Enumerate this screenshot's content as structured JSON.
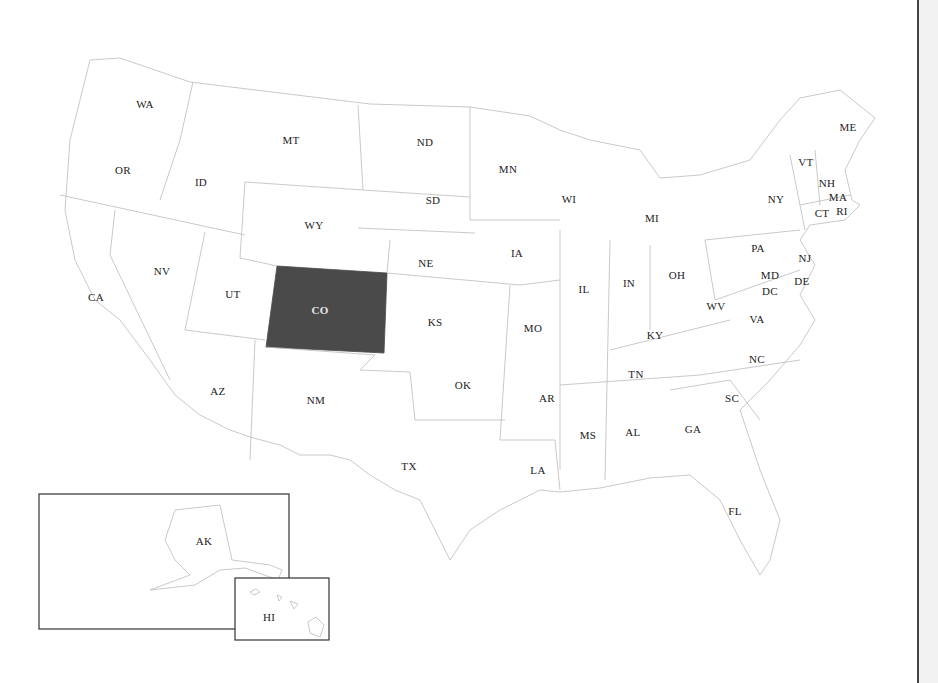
{
  "map": {
    "title": "United States map with Colorado highlighted",
    "highlight_color": "#4a4a4a",
    "highlighted_state": "CO",
    "states": [
      {
        "code": "WA",
        "x": 145,
        "y": 104
      },
      {
        "code": "OR",
        "x": 123,
        "y": 170
      },
      {
        "code": "CA",
        "x": 96,
        "y": 297
      },
      {
        "code": "ID",
        "x": 201,
        "y": 182
      },
      {
        "code": "NV",
        "x": 162,
        "y": 271
      },
      {
        "code": "MT",
        "x": 291,
        "y": 140
      },
      {
        "code": "WY",
        "x": 314,
        "y": 225
      },
      {
        "code": "UT",
        "x": 233,
        "y": 294
      },
      {
        "code": "CO",
        "x": 320,
        "y": 310
      },
      {
        "code": "AZ",
        "x": 218,
        "y": 391
      },
      {
        "code": "NM",
        "x": 316,
        "y": 400
      },
      {
        "code": "ND",
        "x": 425,
        "y": 142
      },
      {
        "code": "SD",
        "x": 433,
        "y": 200
      },
      {
        "code": "NE",
        "x": 426,
        "y": 263
      },
      {
        "code": "KS",
        "x": 435,
        "y": 322
      },
      {
        "code": "OK",
        "x": 463,
        "y": 385
      },
      {
        "code": "TX",
        "x": 409,
        "y": 466
      },
      {
        "code": "MN",
        "x": 508,
        "y": 169
      },
      {
        "code": "IA",
        "x": 517,
        "y": 253
      },
      {
        "code": "MO",
        "x": 533,
        "y": 328
      },
      {
        "code": "AR",
        "x": 547,
        "y": 398
      },
      {
        "code": "LA",
        "x": 538,
        "y": 470
      },
      {
        "code": "WI",
        "x": 569,
        "y": 199
      },
      {
        "code": "IL",
        "x": 584,
        "y": 289
      },
      {
        "code": "MI",
        "x": 652,
        "y": 218
      },
      {
        "code": "IN",
        "x": 629,
        "y": 283
      },
      {
        "code": "OH",
        "x": 677,
        "y": 275
      },
      {
        "code": "KY",
        "x": 655,
        "y": 335
      },
      {
        "code": "TN",
        "x": 636,
        "y": 374
      },
      {
        "code": "MS",
        "x": 588,
        "y": 435
      },
      {
        "code": "AL",
        "x": 633,
        "y": 432
      },
      {
        "code": "GA",
        "x": 693,
        "y": 429
      },
      {
        "code": "FL",
        "x": 735,
        "y": 511
      },
      {
        "code": "SC",
        "x": 732,
        "y": 398
      },
      {
        "code": "NC",
        "x": 757,
        "y": 359
      },
      {
        "code": "VA",
        "x": 757,
        "y": 319
      },
      {
        "code": "WV",
        "x": 716,
        "y": 306
      },
      {
        "code": "PA",
        "x": 758,
        "y": 248
      },
      {
        "code": "NY",
        "x": 776,
        "y": 199
      },
      {
        "code": "VT",
        "x": 806,
        "y": 162
      },
      {
        "code": "NH",
        "x": 827,
        "y": 183
      },
      {
        "code": "ME",
        "x": 848,
        "y": 127
      },
      {
        "code": "MA",
        "x": 838,
        "y": 197
      },
      {
        "code": "RI",
        "x": 842,
        "y": 211
      },
      {
        "code": "CT",
        "x": 822,
        "y": 213
      },
      {
        "code": "NJ",
        "x": 805,
        "y": 258
      },
      {
        "code": "DE",
        "x": 802,
        "y": 281
      },
      {
        "code": "MD",
        "x": 770,
        "y": 275
      },
      {
        "code": "DC",
        "x": 770,
        "y": 291
      },
      {
        "code": "AK",
        "x": 204,
        "y": 541
      },
      {
        "code": "HI",
        "x": 269,
        "y": 617
      }
    ]
  }
}
